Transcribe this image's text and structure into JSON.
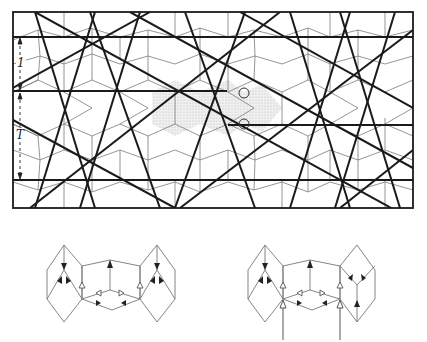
{
  "figure": {
    "type": "quasiperiodic-tiling-with-ammann-bars",
    "labels": {
      "short_spacing": "1",
      "long_spacing": "T"
    },
    "frame": {
      "x": 13,
      "y": 12,
      "width": 400,
      "height": 196
    },
    "horizontal_bars": [
      {
        "y": 12,
        "x1": 13,
        "x2": 413
      },
      {
        "y": 37,
        "x1": 13,
        "x2": 413
      },
      {
        "y": 91,
        "x1": 13,
        "x2": 227
      },
      {
        "y": 125,
        "x1": 228,
        "x2": 413
      },
      {
        "y": 180,
        "x1": 13,
        "x2": 413
      },
      {
        "y": 208,
        "x1": 13,
        "x2": 413
      }
    ],
    "markers": [
      {
        "cx": 244,
        "cy": 93,
        "r": 5
      },
      {
        "cx": 244,
        "cy": 124,
        "r": 5
      }
    ],
    "subdiagrams": [
      {
        "name": "left-arrow-decoration",
        "cx": 112,
        "cy": 283
      },
      {
        "name": "right-arrow-decoration",
        "cx": 312,
        "cy": 283,
        "input_arrows": 2
      }
    ],
    "colors": {
      "bar": "#1a1a1a",
      "tiling": "#777777",
      "shade": "#dcdcdc",
      "background": "#ffffff"
    }
  }
}
